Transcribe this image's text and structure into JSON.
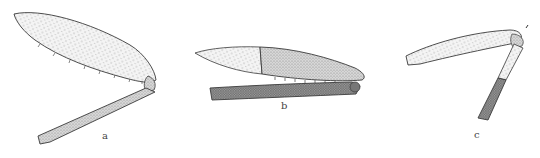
{
  "figure": {
    "panels": [
      {
        "id": "a",
        "label": "a",
        "subject": "insect-leg-femur-tibia",
        "label_x": 102,
        "label_y": 131
      },
      {
        "id": "b",
        "label": "b",
        "subject": "insect-leg-femur-tibia-folded",
        "label_x": 281,
        "label_y": 101
      },
      {
        "id": "c",
        "label": "c",
        "subject": "insect-leg-femur-tibia-bent",
        "label_x": 474,
        "label_y": 130
      }
    ],
    "colors": {
      "ink": "#3a3a3a",
      "light_stipple": "#bdbdbd",
      "dark_stipple": "#7a7a7a",
      "background": "#ffffff"
    }
  }
}
